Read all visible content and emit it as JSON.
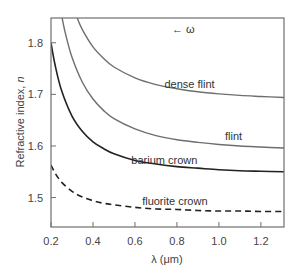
{
  "chart_data": {
    "type": "line",
    "title": "",
    "xlabel": "λ (μm)",
    "ylabel": "Refractive index, n",
    "ylabel_italic_part": "n",
    "xlim": [
      0.2,
      1.31
    ],
    "ylim": [
      1.443,
      1.848
    ],
    "xticks": [
      0.2,
      0.4,
      0.6,
      0.8,
      1.0,
      1.2
    ],
    "xtick_labels": [
      "0.2",
      "0.4",
      "0.6",
      "0.8",
      "1.0",
      "1.2"
    ],
    "yticks": [
      1.5,
      1.6,
      1.7,
      1.8
    ],
    "ytick_labels": [
      "1.5",
      "1.6",
      "1.7",
      "1.8"
    ],
    "grid": false,
    "legend": "none (inline curve labels)",
    "annotation": "← ω",
    "series": [
      {
        "name": "dense flint",
        "color": "#6e6e6e",
        "dash": "solid",
        "x": [
          0.325,
          0.35,
          0.4,
          0.45,
          0.5,
          0.6,
          0.7,
          0.8,
          0.9,
          1.0,
          1.1,
          1.2,
          1.31
        ],
        "y": [
          1.848,
          1.825,
          1.792,
          1.77,
          1.753,
          1.732,
          1.719,
          1.711,
          1.705,
          1.701,
          1.698,
          1.696,
          1.694
        ]
      },
      {
        "name": "flint",
        "color": "#6e6e6e",
        "dash": "solid",
        "x": [
          0.253,
          0.27,
          0.3,
          0.35,
          0.4,
          0.45,
          0.5,
          0.6,
          0.7,
          0.8,
          0.9,
          1.0,
          1.1,
          1.2,
          1.31
        ],
        "y": [
          1.848,
          1.816,
          1.772,
          1.723,
          1.691,
          1.669,
          1.653,
          1.633,
          1.62,
          1.612,
          1.607,
          1.603,
          1.6,
          1.598,
          1.596
        ]
      },
      {
        "name": "barium crown",
        "color": "#222222",
        "dash": "solid",
        "x": [
          0.2,
          0.22,
          0.25,
          0.3,
          0.35,
          0.4,
          0.45,
          0.5,
          0.6,
          0.7,
          0.8,
          0.9,
          1.0,
          1.1,
          1.2,
          1.31
        ],
        "y": [
          1.8,
          1.756,
          1.708,
          1.658,
          1.628,
          1.608,
          1.595,
          1.585,
          1.572,
          1.565,
          1.56,
          1.557,
          1.554,
          1.552,
          1.551,
          1.55
        ]
      },
      {
        "name": "fluorite crown",
        "color": "#222222",
        "dash": "dashed",
        "x": [
          0.2,
          0.22,
          0.25,
          0.3,
          0.35,
          0.4,
          0.45,
          0.5,
          0.6,
          0.7,
          0.8,
          0.9,
          1.0,
          1.1,
          1.2,
          1.31
        ],
        "y": [
          1.563,
          1.547,
          1.53,
          1.512,
          1.501,
          1.494,
          1.489,
          1.486,
          1.481,
          1.478,
          1.477,
          1.475,
          1.474,
          1.474,
          1.473,
          1.473
        ]
      }
    ],
    "labels": [
      {
        "text": "dense flint",
        "x": 0.86,
        "y": 1.712
      },
      {
        "text": "flint",
        "x": 1.07,
        "y": 1.612
      },
      {
        "text": "barium crown",
        "x": 0.74,
        "y": 1.566
      },
      {
        "text": "fluorite crown",
        "x": 0.79,
        "y": 1.486
      }
    ],
    "annotation_pos": {
      "x": 0.83,
      "y": 1.818
    }
  }
}
